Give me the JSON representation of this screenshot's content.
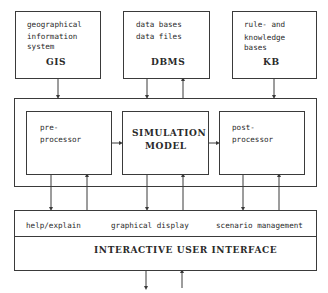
{
  "diagram": {
    "top_boxes": [
      {
        "lines": [
          "geographical",
          "information",
          "system"
        ],
        "acronym": "GIS"
      },
      {
        "lines": [
          "data bases",
          "data files"
        ],
        "acronym": "DBMS"
      },
      {
        "lines": [
          "rule- and",
          "knowledge",
          "bases"
        ],
        "acronym": "KB"
      }
    ],
    "core": {
      "preprocessor": [
        "pre-",
        "processor"
      ],
      "simulation_model": [
        "SIMULATION",
        "MODEL"
      ],
      "postprocessor": [
        "post-",
        "processor"
      ]
    },
    "user_interface": {
      "functions": [
        "help/explain",
        "graphical display",
        "scenario management"
      ],
      "title": "INTERACTIVE USER INTERFACE"
    },
    "colors": {
      "line": "#3a3a3a",
      "text": "#2a2a2a",
      "background": "#ffffff"
    }
  }
}
